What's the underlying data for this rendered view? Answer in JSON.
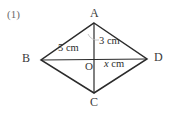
{
  "figure": {
    "problem_number": "(1)",
    "shape": "rhombus",
    "background_color": "#ffffff",
    "stroke_color": "#2b2b2b",
    "vertices": {
      "a": {
        "label": "A",
        "x": 94,
        "y": 23
      },
      "b": {
        "label": "B",
        "x": 41,
        "y": 60
      },
      "c": {
        "label": "C",
        "x": 94,
        "y": 93
      },
      "d": {
        "label": "D",
        "x": 147,
        "y": 59
      },
      "o": {
        "label": "O",
        "x": 94,
        "y": 59
      }
    },
    "measurements": {
      "side_ba": "5 cm",
      "segment_ao": "3 cm",
      "segment_od_value": "x",
      "segment_od_unit": "cm"
    }
  }
}
